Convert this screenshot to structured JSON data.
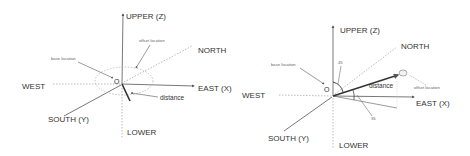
{
  "left_diagram": {
    "labels": {
      "upper": "UPPER (Z)",
      "lower": "LOWER",
      "north": "NORTH",
      "south": "SOUTH (Y)",
      "east": "EAST (X)",
      "west": "WEST",
      "origin": "O",
      "base_location": "base location",
      "offset_location": "offset location",
      "distance": "distance"
    }
  },
  "right_diagram": {
    "labels": {
      "upper": "UPPER (Z)",
      "lower": "LOWER",
      "north": "NORTH",
      "south": "SOUTH (Y)",
      "east": "EAST (X)",
      "west": "WEST",
      "origin": "O",
      "base_location": "base location",
      "offset_location": "offset location",
      "distance": "distance",
      "angle_vertical": "45",
      "angle_horizontal": "35"
    }
  },
  "colors": {
    "axis": "#555555",
    "dotted": "#aaaaaa",
    "text": "#333333"
  }
}
